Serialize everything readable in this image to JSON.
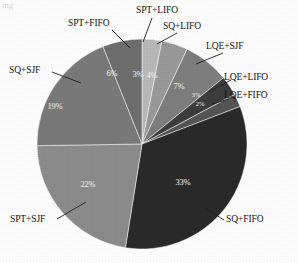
{
  "figure": {
    "corner_artifact": "ing",
    "center_x": 142,
    "center_y": 144,
    "radius": 105
  },
  "chart_data": {
    "type": "pie",
    "title": "",
    "xlabel": "",
    "ylabel": "",
    "legend_position": "callout-labels",
    "grid": false,
    "units": "percent",
    "total": 99,
    "start_angle_deg": -90,
    "direction": "clockwise",
    "categories": [
      "SQ+FIFO",
      "SPT+SJF",
      "SQ+SJF",
      "SPT+FIFO",
      "SPT+LIFO",
      "SQ+LIFO",
      "LQE+SJF",
      "LQE+LIFO",
      "LQE+FIFO"
    ],
    "values": [
      33,
      22,
      19,
      6,
      3,
      4,
      7,
      3,
      2
    ],
    "slices": [
      {
        "label": "SPT+LIFO",
        "value": 3,
        "pct_text": "3%",
        "color": "#b9b9b9",
        "pct_x": 138,
        "pct_y": 77,
        "label_x": 136,
        "label_y": 6,
        "leader": "M 152 18 L 143 42"
      },
      {
        "label": "SQ+LIFO",
        "value": 4,
        "pct_text": "4%",
        "color": "#9a9a9a",
        "pct_x": 152,
        "pct_y": 78,
        "label_x": 163,
        "label_y": 22,
        "leader": "M 177 33 L 157 44"
      },
      {
        "label": "LQE+SJF",
        "value": 7,
        "pct_text": "7%",
        "color": "#7e7e7e",
        "pct_x": 179,
        "pct_y": 89,
        "label_x": 206,
        "label_y": 42,
        "leader": "M 223 53 L 196 64"
      },
      {
        "label": "LQE+LIFO",
        "value": 3,
        "pct_text": "3%",
        "color": "#3d3d3d",
        "pct_x": 196,
        "pct_y": 97,
        "label_x": 224,
        "label_y": 73,
        "leader": "M 231 80 L 208 92"
      },
      {
        "label": "LQE+FIFO",
        "value": 2,
        "pct_text": "2%",
        "color": "#555555",
        "pct_x": 200,
        "pct_y": 106,
        "label_x": 224,
        "label_y": 91,
        "leader": "M 229 99 L 212 104"
      },
      {
        "label": "SQ+FIFO",
        "value": 33,
        "pct_text": "33%",
        "color": "#2a2a2a",
        "pct_x": 183,
        "pct_y": 185,
        "label_x": 226,
        "label_y": 215,
        "leader": "M 224 220 L 205 208"
      },
      {
        "label": "SPT+SJF",
        "value": 22,
        "pct_text": "22%",
        "color": "#8c8c8c",
        "pct_x": 88,
        "pct_y": 187,
        "label_x": 10,
        "label_y": 215,
        "leader": "M 57 219 L 86 202"
      },
      {
        "label": "SQ+SJF",
        "value": 19,
        "pct_text": "19%",
        "color": "#7a7a7a",
        "pct_x": 55,
        "pct_y": 109,
        "label_x": 9,
        "label_y": 66,
        "leader": "M 52 72 L 81 83"
      },
      {
        "label": "SPT+FIFO",
        "value": 6,
        "pct_text": "6%",
        "color": "#6e6e6e",
        "pct_x": 112,
        "pct_y": 76,
        "label_x": 68,
        "label_y": 19,
        "leader": "M 112 30 L 130 48"
      }
    ]
  }
}
